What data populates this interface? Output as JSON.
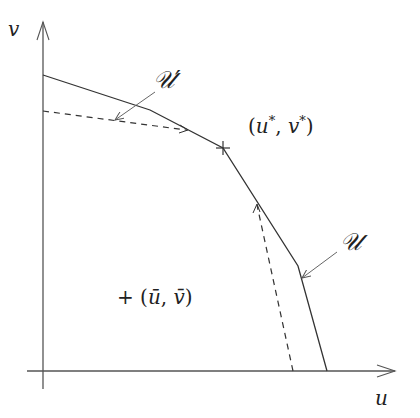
{
  "diagram": {
    "type": "pareto-frontier-sketch",
    "axes": {
      "x_label": "u",
      "y_label": "v",
      "color": "#555555"
    },
    "curves": {
      "solid": {
        "name": "U",
        "label": "𝒰",
        "style": "solid",
        "points": [
          [
            43,
            75
          ],
          [
            150,
            110
          ],
          [
            223,
            148
          ],
          [
            298,
            266
          ],
          [
            327,
            371
          ]
        ]
      },
      "dashed": {
        "name": "U'",
        "label": "𝒰′",
        "style": "dashed",
        "segments": [
          [
            [
              43,
              111
            ],
            [
              186,
              130
            ]
          ],
          [
            [
              257,
              205
            ],
            [
              293,
              371
            ]
          ]
        ]
      }
    },
    "points": {
      "star": {
        "label": "(u*, v*)",
        "label_text": "(u",
        "sup1": "*",
        "mid": ", v",
        "sup2": "*",
        "close": ")",
        "marker": "+",
        "x": 223,
        "y": 148
      },
      "bar": {
        "label": "+ (ū, v̄)",
        "text": "+ (ū, v̄)",
        "x": 115,
        "y": 300
      }
    },
    "labels": {
      "u_prime": "𝒰′",
      "u": "𝒰",
      "x_axis": "u",
      "y_axis": "v"
    },
    "colors": {
      "line": "#333333",
      "arrow": "#666666"
    }
  }
}
